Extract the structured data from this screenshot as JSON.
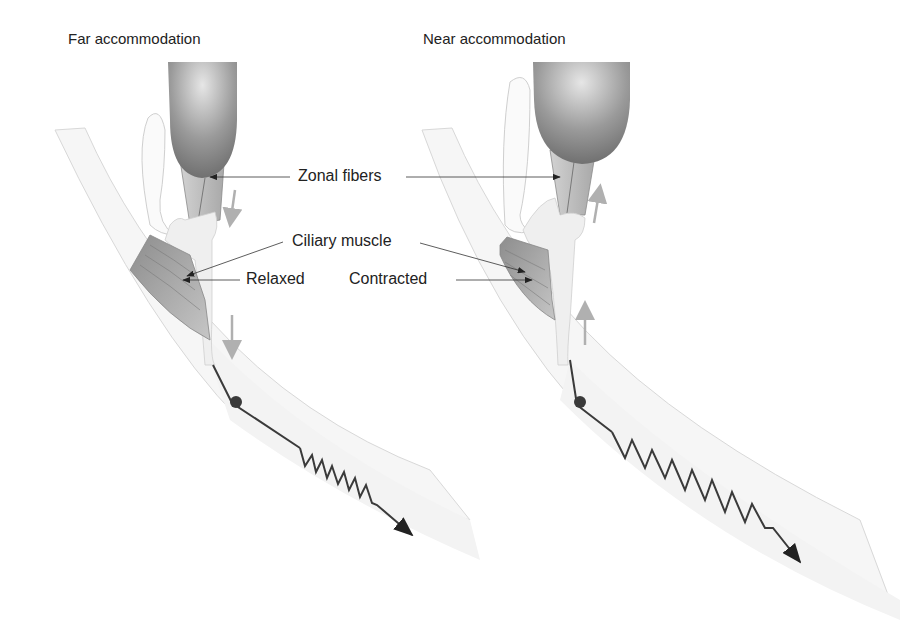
{
  "panels": {
    "far": {
      "title": "Far accommodation",
      "state_label": "Relaxed"
    },
    "near": {
      "title": "Near accommodation",
      "state_label": "Contracted"
    }
  },
  "labels": {
    "zonal_fibers": "Zonal fibers",
    "ciliary_muscle": "Ciliary muscle"
  },
  "colors": {
    "lens_dark": "#7a7a7a",
    "lens_light": "#e0e0e0",
    "fiber": "#bdbdbd",
    "muscle": "#9c9c9c",
    "tissue": "#ededed",
    "wall": "#f4f4f4",
    "arrow_gray": "#b0b0b0",
    "line": "#333333"
  }
}
